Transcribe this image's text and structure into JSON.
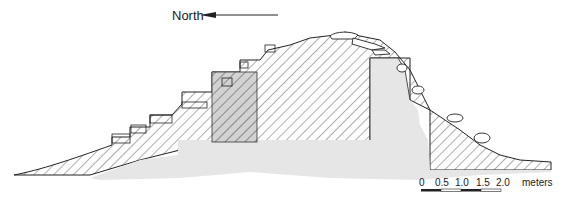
{
  "diagram": {
    "type": "archaeological cross-section",
    "orientation_label": "North",
    "orientation_arrow_direction": "left",
    "scale_bar": {
      "ticks": [
        "0",
        "0.5",
        "1.0",
        "1.5",
        "2.0"
      ],
      "unit": "meters",
      "max_value": 2.0,
      "segment_count": 4
    },
    "layers": [
      {
        "name": "fill-hatched",
        "pattern": "diagonal-hatch"
      },
      {
        "name": "core-stippled",
        "pattern": "gray-fill"
      },
      {
        "name": "inner-block-dark-hatched",
        "pattern": "gray-fill-with-hatch"
      },
      {
        "name": "upper-stone-courses",
        "pattern": "outlined-stones"
      }
    ],
    "colors": {
      "line": "#222222",
      "core_fill": "#e6e6e6",
      "inner_block_fill": "#d2d2d2",
      "background": "#ffffff"
    }
  }
}
